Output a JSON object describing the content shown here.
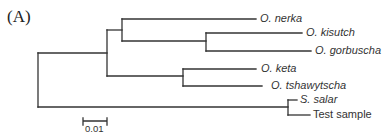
{
  "figure": {
    "panel_label": "(A)",
    "line_color": "#333333",
    "taxa": [
      {
        "label": "O. nerka",
        "italic": true
      },
      {
        "label": "O. kisutch",
        "italic": true
      },
      {
        "label": "O. gorbuscha",
        "italic": true
      },
      {
        "label": "O. keta",
        "italic": true
      },
      {
        "label": "O. tshawytscha",
        "italic": true
      },
      {
        "label": "S. salar",
        "italic": true
      },
      {
        "label": "Test sample",
        "italic": false
      }
    ],
    "scale_bar": {
      "label": "0.01"
    }
  }
}
